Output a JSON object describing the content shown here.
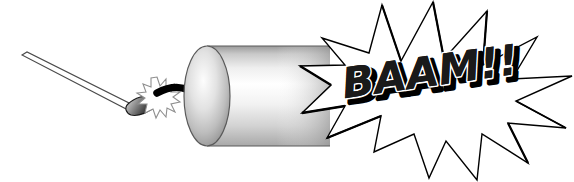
{
  "canvas": {
    "width": 574,
    "height": 182,
    "background": "#ffffff",
    "title": "Lit match igniting a firecracker with BAAM!! explosion"
  },
  "illustration": {
    "name": "firecracker-explosion-clipart",
    "style": "black-and-white grayscale clipart line art",
    "objects": [
      {
        "id": "matchstick",
        "label": "Match stick",
        "description": "Thin white outlined wooden stick angled down-right",
        "fill": "#ffffff",
        "stroke": "#000000"
      },
      {
        "id": "match-head",
        "label": "Match head",
        "description": "Dark teardrop shaped burning match head",
        "fill_dark": "#3a3a3a",
        "fill_light": "#d8d8d8",
        "stroke": "#000000"
      },
      {
        "id": "spark",
        "label": "Ignition spark",
        "description": "Small many-pointed starburst spark at the fuse tip",
        "fill": "#ffffff",
        "stroke": "#9a9a9a"
      },
      {
        "id": "fuse",
        "label": "Fuse",
        "description": "Thick black S-curved fuse from spark to cylinder",
        "stroke": "#000000"
      },
      {
        "id": "firecracker-body",
        "label": "Firecracker cylinder",
        "description": "Horizontal gray gradient cylinder with elliptical left end cap",
        "fill_light": "#ffffff",
        "fill_mid": "#dcdcdc",
        "fill_dark": "#8c8c8c",
        "stroke": "#555555"
      },
      {
        "id": "explosion-burst",
        "label": "Explosion starburst",
        "description": "Large 12-point white starburst with black outline",
        "fill": "#ffffff",
        "stroke": "#000000"
      }
    ]
  },
  "blast": {
    "text": "BAAM!!",
    "text_color": "#1a1a1a",
    "outline_color": "#ffffff",
    "shadow_color": "#000000",
    "rotation_deg": -8
  },
  "colors": {
    "background": "#ffffff",
    "ink": "#000000",
    "gray_dark": "#8c8c8c",
    "gray_mid": "#c8c8c8",
    "gray_light": "#ededed",
    "outline": "#555555"
  }
}
